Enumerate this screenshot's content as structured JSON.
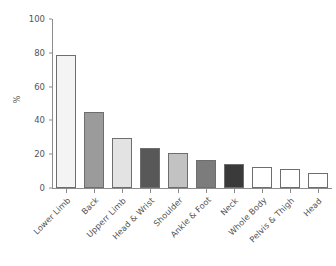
{
  "chart_data": {
    "type": "bar",
    "title": "",
    "xlabel": "",
    "ylabel": "%",
    "ylim": [
      0,
      100
    ],
    "yticks": [
      0,
      20,
      40,
      60,
      80,
      100
    ],
    "ytick_labels": [
      "0",
      "20",
      "40",
      "60",
      "80",
      "100"
    ],
    "grid": false,
    "legend": "none",
    "orientation": "vertical",
    "xtick_rotation": -45,
    "categories": [
      "Lower Limb",
      "Back",
      "Upperr Limb",
      "Head & Wrist",
      "Shoulder",
      "Ankle & Foot",
      "Neck",
      "Whole Body",
      "Pelvis & Thigh",
      "Head"
    ],
    "values": [
      79,
      45,
      29.5,
      23.5,
      20.5,
      16.5,
      14,
      12.5,
      11,
      9
    ],
    "bar_colors": [
      "#f4f4f4",
      "#9b9b9b",
      "#e3e3e3",
      "#585858",
      "#c2c2c2",
      "#7c7c7c",
      "#3a3a3a",
      "#ffffff",
      "#ffffff",
      "#ffffff"
    ],
    "bar_edge_color": "#6e6e6e",
    "axis_color": "#8c8c8c",
    "text_color": "#555555",
    "background": "#ffffff"
  }
}
